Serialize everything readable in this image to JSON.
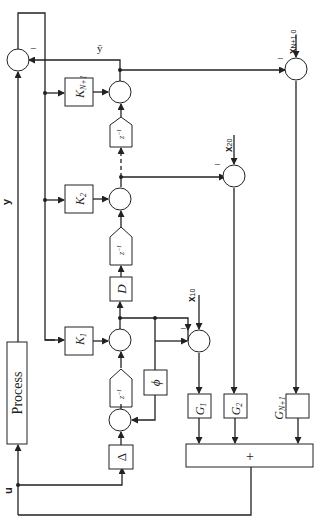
{
  "diagram": {
    "process_label": "Process",
    "signals": {
      "u": "u",
      "y": "y",
      "ybar": "ȳ",
      "x10": "x",
      "x10_sub": "10",
      "x20": "x",
      "x20_sub": "20",
      "xN10": "x",
      "xN10_sub": "N+1,0"
    },
    "gains": {
      "K1": "K",
      "K1_sub": "1",
      "K2": "K",
      "K2_sub": "2",
      "KN1": "K",
      "KN1_sub": "N+1"
    },
    "blocks": {
      "delta": "Δ",
      "phi": "ϕ",
      "D": "D",
      "delay": "z",
      "delay_sup": "−1",
      "delay_sub": "d",
      "G1": "G",
      "G1_sub": "1",
      "G2": "G",
      "G2_sub": "2",
      "GN1": "G",
      "GN1_sub": "N+1",
      "sum_plus": "+"
    },
    "signs": {
      "minus": "−"
    }
  }
}
